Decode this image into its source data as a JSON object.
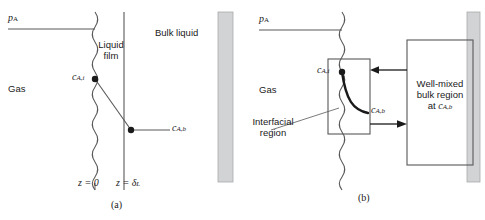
{
  "figure": {
    "panels": [
      {
        "id": "a",
        "caption": "(a)",
        "labels": {
          "gas_pressure": "p",
          "gas_pressure_sub": "A",
          "gas": "Gas",
          "liquid_film_line1": "Liquid",
          "liquid_film_line2": "film",
          "bulk_liquid": "Bulk liquid",
          "c_interface_main": "c",
          "c_interface_sub": "A,i",
          "c_bulk_main": "c",
          "c_bulk_sub": "A,b",
          "z_zero": "z = 0",
          "z_delta_main": "z = δ",
          "z_delta_sub": "L"
        }
      },
      {
        "id": "b",
        "caption": "(b)",
        "labels": {
          "gas_pressure": "p",
          "gas_pressure_sub": "A",
          "gas": "Gas",
          "interfacial_line1": "Interfacial",
          "interfacial_line2": "region",
          "wellmixed_line1": "Well-mixed",
          "wellmixed_line2": "bulk region",
          "wellmixed_line3_pre": "at ",
          "wellmixed_line3_main": "c",
          "wellmixed_line3_sub": "A,b",
          "c_interface_main": "c",
          "c_interface_sub": "A,i",
          "c_bulk_main": "c",
          "c_bulk_sub": "A,b"
        }
      }
    ],
    "colors": {
      "line": "#58585a",
      "dark_line": "#1a1a1a",
      "wall_fill": "#d2d3d4",
      "wall_stroke": "#a9aaac",
      "text": "#1a1a1a",
      "background": "#ffffff"
    }
  }
}
